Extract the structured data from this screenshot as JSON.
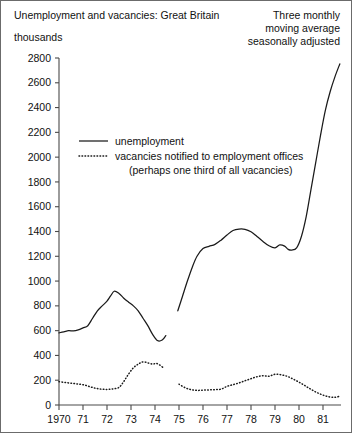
{
  "chart_data": {
    "type": "line",
    "title": "Unemployment and vacancies: Great Britain",
    "units_label": "thousands",
    "note_lines": [
      "Three monthly",
      "moving average",
      "seasonally adjusted"
    ],
    "xlabel": "",
    "ylabel": "thousands",
    "grid": false,
    "legend_position": "upper-left-inside",
    "ylim": [
      0,
      2800
    ],
    "xlim": [
      1970,
      1981.75
    ],
    "ytick_labels": [
      "0",
      "200",
      "400",
      "600",
      "800",
      "1000",
      "1200",
      "1400",
      "1600",
      "1800",
      "2000",
      "2200",
      "2400",
      "2600",
      "2800"
    ],
    "ytick_values": [
      0,
      200,
      400,
      600,
      800,
      1000,
      1200,
      1400,
      1600,
      1800,
      2000,
      2200,
      2400,
      2600,
      2800
    ],
    "xtick_labels": [
      "1970",
      "71",
      "72",
      "73",
      "74",
      "75",
      "76",
      "77",
      "78",
      "79",
      "80",
      "81"
    ],
    "xtick_values": [
      1970,
      1971,
      1972,
      1973,
      1974,
      1975,
      1976,
      1977,
      1978,
      1979,
      1980,
      1981
    ],
    "series": [
      {
        "name": "unemployment",
        "style": "solid",
        "segments": [
          {
            "x": [
              1970.0,
              1970.2,
              1970.4,
              1970.6,
              1970.8,
              1971.0,
              1971.2,
              1971.4,
              1971.6,
              1971.8,
              1972.0,
              1972.15,
              1972.3,
              1972.5,
              1972.7,
              1972.9,
              1973.1,
              1973.3,
              1973.5,
              1973.7,
              1973.9,
              1974.1,
              1974.3,
              1974.45
            ],
            "y": [
              582,
              590,
              600,
              598,
              606,
              622,
              640,
              700,
              760,
              800,
              838,
              880,
              918,
              900,
              862,
              830,
              800,
              760,
              700,
              640,
              570,
              520,
              524,
              560
            ]
          },
          {
            "x": [
              1974.95,
              1975.15,
              1975.35,
              1975.55,
              1975.75,
              1976.0,
              1976.25,
              1976.5,
              1976.75,
              1977.0,
              1977.25,
              1977.5,
              1977.75,
              1978.0,
              1978.25,
              1978.5,
              1978.75,
              1979.0,
              1979.2,
              1979.4,
              1979.55,
              1979.7,
              1979.9,
              1980.1,
              1980.3,
              1980.5,
              1980.7,
              1980.9,
              1981.1,
              1981.3,
              1981.5,
              1981.7
            ],
            "y": [
              760,
              880,
              1000,
              1110,
              1200,
              1262,
              1280,
              1296,
              1330,
              1372,
              1408,
              1420,
              1418,
              1398,
              1360,
              1320,
              1285,
              1268,
              1292,
              1282,
              1256,
              1250,
              1268,
              1360,
              1520,
              1740,
              1960,
              2180,
              2380,
              2530,
              2650,
              2752
            ]
          }
        ]
      },
      {
        "name": "vacancies notified to employment offices",
        "sublabel": "(perhaps one third of all vacancies)",
        "style": "dotted",
        "segments": [
          {
            "x": [
              1970.0,
              1970.25,
              1970.5,
              1970.75,
              1971.0,
              1971.25,
              1971.5,
              1971.75,
              1972.0,
              1972.25,
              1972.5,
              1972.7,
              1972.9,
              1973.1,
              1973.3,
              1973.5,
              1973.7,
              1973.9,
              1974.05,
              1974.2,
              1974.35
            ],
            "y": [
              188,
              182,
              176,
              170,
              164,
              150,
              136,
              128,
              126,
              130,
              142,
              190,
              250,
              300,
              330,
              348,
              340,
              330,
              336,
              322,
              300
            ]
          },
          {
            "x": [
              1975.0,
              1975.25,
              1975.5,
              1975.75,
              1976.0,
              1976.25,
              1976.5,
              1976.75,
              1977.0,
              1977.25,
              1977.5,
              1977.75,
              1978.0,
              1978.25,
              1978.5,
              1978.75,
              1979.0,
              1979.25,
              1979.5,
              1979.75,
              1980.0,
              1980.25,
              1980.5,
              1980.75,
              1981.0,
              1981.25,
              1981.5,
              1981.7
            ],
            "y": [
              168,
              140,
              124,
              118,
              120,
              122,
              124,
              128,
              150,
              164,
              178,
              196,
              212,
              228,
              236,
              232,
              248,
              244,
              232,
              210,
              184,
              156,
              126,
              100,
              80,
              66,
              62,
              72
            ]
          }
        ]
      }
    ]
  }
}
